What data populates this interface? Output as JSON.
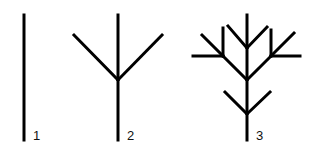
{
  "diagram": {
    "stroke_color": "#000000",
    "background": "#ffffff",
    "stages": [
      {
        "label": "1",
        "label_pos": [
          33,
          129
        ],
        "segments": [
          [
            24,
            15,
            24,
            140
          ]
        ]
      },
      {
        "label": "2",
        "label_pos": [
          127,
          129
        ],
        "segments": [
          [
            118,
            15,
            118,
            140
          ],
          [
            118,
            80,
            74,
            35
          ],
          [
            118,
            80,
            162,
            35
          ]
        ]
      },
      {
        "label": "3",
        "label_pos": [
          256,
          129
        ],
        "segments": [
          [
            247,
            15,
            247,
            140
          ],
          [
            247,
            114,
            225,
            92
          ],
          [
            247,
            114,
            270,
            92
          ],
          [
            247,
            80,
            223,
            56
          ],
          [
            247,
            80,
            271,
            56
          ],
          [
            223,
            56,
            223,
            28
          ],
          [
            223,
            56,
            193,
            56
          ],
          [
            223,
            56,
            202,
            35
          ],
          [
            271,
            56,
            271,
            30
          ],
          [
            271,
            56,
            300,
            56
          ],
          [
            271,
            56,
            294,
            33
          ],
          [
            247,
            48,
            228,
            26
          ],
          [
            247,
            48,
            267,
            27
          ]
        ]
      }
    ]
  }
}
